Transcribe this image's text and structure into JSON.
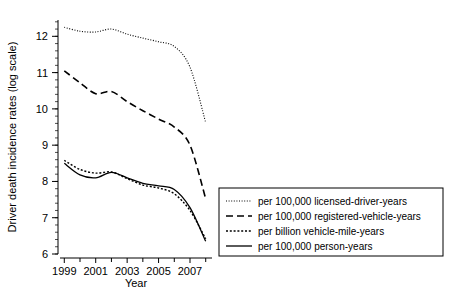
{
  "chart_data": {
    "type": "line",
    "title": "",
    "xlabel": "Year",
    "ylabel": "Driver death incidence rates (log scale)",
    "xlim": [
      1998.6,
      2008.4
    ],
    "ylim": [
      6,
      12.45
    ],
    "grid": false,
    "legend_position": "right-bottom",
    "xticks": [
      1999,
      2001,
      2003,
      2005,
      2007
    ],
    "xticklabels": [
      "1999",
      "2001",
      "2003",
      "2005",
      "2007"
    ],
    "xminorticks": [
      2000,
      2002,
      2004,
      2006,
      2008
    ],
    "yticks": [
      6,
      7,
      8,
      9,
      10,
      11,
      12
    ],
    "yticklabels": [
      "6",
      "7",
      "8",
      "9",
      "10",
      "11",
      "12"
    ],
    "x": [
      1999,
      2000,
      2001,
      2002,
      2003,
      2004,
      2005,
      2006,
      2007,
      2008
    ],
    "series": [
      {
        "name": "per 100,000 licensed-driver-years",
        "style": "dotted",
        "values": [
          12.25,
          12.14,
          12.12,
          12.2,
          12.06,
          11.95,
          11.85,
          11.72,
          11.15,
          9.62
        ]
      },
      {
        "name": "per 100,000 registered-vehicle-years",
        "style": "dashed",
        "values": [
          11.05,
          10.72,
          10.42,
          10.48,
          10.2,
          9.95,
          9.72,
          9.5,
          9.0,
          7.52
        ]
      },
      {
        "name": "per billion vehicle-mile-years",
        "style": "fine-dotted",
        "values": [
          8.58,
          8.33,
          8.23,
          8.26,
          8.08,
          7.9,
          7.82,
          7.66,
          7.2,
          6.42
        ]
      },
      {
        "name": "per 100,000 person-years",
        "style": "solid",
        "values": [
          8.5,
          8.18,
          8.1,
          8.25,
          8.1,
          7.95,
          7.88,
          7.78,
          7.28,
          6.35
        ]
      }
    ]
  },
  "axes": {
    "x_title": "Year",
    "y_title": "Driver death incidence rates (log scale)",
    "x_tick_labels": [
      "1999",
      "2001",
      "2003",
      "2005",
      "2007"
    ],
    "y_tick_labels": [
      "12",
      "11",
      "10",
      "9",
      "8",
      "7",
      "6"
    ]
  },
  "legend": {
    "entries": [
      {
        "label": "per 100,000 licensed-driver-years",
        "style": "dotted"
      },
      {
        "label": "per 100,000 registered-vehicle-years",
        "style": "dashed"
      },
      {
        "label": "per billion vehicle-mile-years",
        "style": "fine-dotted"
      },
      {
        "label": "per 100,000 person-years",
        "style": "solid"
      }
    ]
  },
  "colors": {
    "line": "#000000",
    "axis": "#000000",
    "background": "#ffffff"
  }
}
